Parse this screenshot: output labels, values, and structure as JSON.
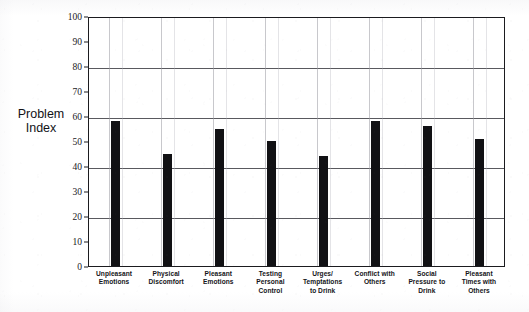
{
  "page": {
    "cropped_header_text": "",
    "background_color": "#ffffff",
    "ink_color": "#111114"
  },
  "chart_data": {
    "type": "bar",
    "title": "",
    "xlabel": "",
    "ylabel": "Problem Index",
    "ylim": [
      0,
      100
    ],
    "ytick_step": 10,
    "grid": "horizontal gridlines at 20, 40, 60, 80; faint vertical separators between categories",
    "legend": "none",
    "bar_color": "#111114",
    "categories": [
      "Unpleasant Emotions",
      "Physical Discomfort",
      "Pleasant Emotions",
      "Testing Personal Control",
      "Urges/ Temptations to Drink",
      "Conflict with Others",
      "Social Pressure to Drink",
      "Pleasant Times with Others"
    ],
    "category_lines": [
      [
        "Unpleasant",
        "Emotions"
      ],
      [
        "Physical",
        "Discomfort"
      ],
      [
        "Pleasant",
        "Emotions"
      ],
      [
        "Testing",
        "Personal",
        "Control"
      ],
      [
        "Urges/",
        "Temptations",
        "to Drink"
      ],
      [
        "Conflict with",
        "Others"
      ],
      [
        "Social",
        "Pressure to",
        "Drink"
      ],
      [
        "Pleasant",
        "Times with",
        "Others"
      ]
    ],
    "values": [
      58,
      45,
      55,
      50,
      44,
      58,
      56,
      51
    ],
    "yticks": [
      0,
      10,
      20,
      30,
      40,
      50,
      60,
      70,
      80,
      90,
      100
    ],
    "gridline_values": [
      20,
      40,
      60,
      80
    ]
  },
  "axis": {
    "y_title_lines": [
      "Problem",
      "Index"
    ]
  }
}
